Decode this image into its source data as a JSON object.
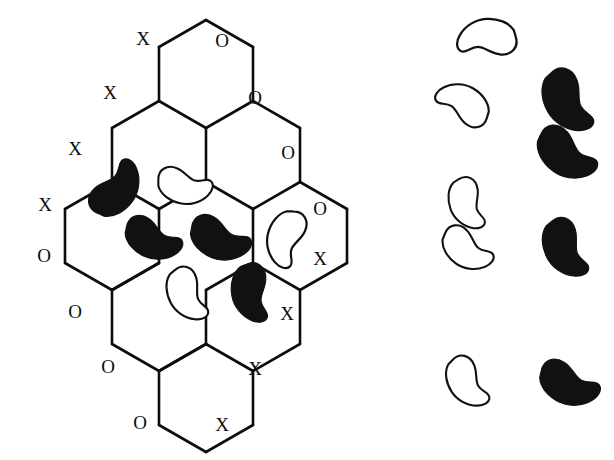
{
  "figure": {
    "width": 614,
    "height": 460,
    "background_color": "#ffffff",
    "line_color": "#0d0d0d",
    "black_bean_color": "#111111",
    "white_bean_fill": "#ffffff"
  },
  "lattice": {
    "shape": "rhombus",
    "hex_columns": 4,
    "hex_radius": 46,
    "edges": [
      [
        [
          206,
          20
        ],
        [
          253,
          47
        ]
      ],
      [
        [
          253,
          47
        ],
        [
          253,
          101
        ]
      ],
      [
        [
          253,
          101
        ],
        [
          206,
          128
        ]
      ],
      [
        [
          206,
          128
        ],
        [
          159,
          101
        ]
      ],
      [
        [
          159,
          101
        ],
        [
          159,
          47
        ]
      ],
      [
        [
          159,
          47
        ],
        [
          206,
          20
        ]
      ],
      [
        [
          253,
          101
        ],
        [
          300,
          128
        ]
      ],
      [
        [
          300,
          128
        ],
        [
          300,
          182
        ]
      ],
      [
        [
          300,
          182
        ],
        [
          253,
          209
        ]
      ],
      [
        [
          253,
          209
        ],
        [
          206,
          182
        ]
      ],
      [
        [
          206,
          182
        ],
        [
          206,
          128
        ]
      ],
      [
        [
          159,
          101
        ],
        [
          112,
          128
        ]
      ],
      [
        [
          112,
          128
        ],
        [
          112,
          182
        ]
      ],
      [
        [
          112,
          182
        ],
        [
          159,
          209
        ]
      ],
      [
        [
          159,
          209
        ],
        [
          206,
          182
        ]
      ],
      [
        [
          300,
          182
        ],
        [
          347,
          209
        ]
      ],
      [
        [
          347,
          209
        ],
        [
          347,
          263
        ]
      ],
      [
        [
          347,
          263
        ],
        [
          300,
          290
        ]
      ],
      [
        [
          300,
          290
        ],
        [
          253,
          263
        ]
      ],
      [
        [
          253,
          263
        ],
        [
          253,
          209
        ]
      ],
      [
        [
          112,
          182
        ],
        [
          65,
          209
        ]
      ],
      [
        [
          65,
          209
        ],
        [
          65,
          263
        ]
      ],
      [
        [
          65,
          263
        ],
        [
          112,
          290
        ]
      ],
      [
        [
          112,
          290
        ],
        [
          159,
          263
        ]
      ],
      [
        [
          159,
          263
        ],
        [
          159,
          209
        ]
      ],
      [
        [
          253,
          263
        ],
        [
          206,
          290
        ]
      ],
      [
        [
          206,
          290
        ],
        [
          206,
          344
        ]
      ],
      [
        [
          206,
          344
        ],
        [
          253,
          371
        ]
      ],
      [
        [
          253,
          371
        ],
        [
          300,
          344
        ]
      ],
      [
        [
          300,
          344
        ],
        [
          300,
          290
        ]
      ],
      [
        [
          159,
          263
        ],
        [
          112,
          290
        ]
      ],
      [
        [
          112,
          290
        ],
        [
          112,
          344
        ]
      ],
      [
        [
          112,
          344
        ],
        [
          159,
          371
        ]
      ],
      [
        [
          159,
          371
        ],
        [
          206,
          344
        ]
      ],
      [
        [
          206,
          344
        ],
        [
          159,
          371
        ]
      ],
      [
        [
          159,
          371
        ],
        [
          159,
          425
        ]
      ],
      [
        [
          159,
          425
        ],
        [
          206,
          452
        ]
      ],
      [
        [
          206,
          452
        ],
        [
          253,
          425
        ]
      ],
      [
        [
          253,
          425
        ],
        [
          253,
          371
        ]
      ]
    ],
    "labels": [
      {
        "text": "X",
        "x": 143,
        "y": 38
      },
      {
        "text": "X",
        "x": 110,
        "y": 92
      },
      {
        "text": "X",
        "x": 75,
        "y": 148
      },
      {
        "text": "X",
        "x": 45,
        "y": 204
      },
      {
        "text": "O",
        "x": 222,
        "y": 40
      },
      {
        "text": "O",
        "x": 255,
        "y": 97
      },
      {
        "text": "O",
        "x": 288,
        "y": 152
      },
      {
        "text": "O",
        "x": 320,
        "y": 208
      },
      {
        "text": "O",
        "x": 44,
        "y": 255
      },
      {
        "text": "O",
        "x": 75,
        "y": 311
      },
      {
        "text": "O",
        "x": 108,
        "y": 366
      },
      {
        "text": "O",
        "x": 140,
        "y": 422
      },
      {
        "text": "X",
        "x": 320,
        "y": 258
      },
      {
        "text": "X",
        "x": 287,
        "y": 313
      },
      {
        "text": "X",
        "x": 255,
        "y": 368
      },
      {
        "text": "X",
        "x": 222,
        "y": 424
      }
    ],
    "label_counts": {
      "X": 8,
      "O": 8
    }
  },
  "lattice_beans": {
    "black_count": 5,
    "white_count": 3,
    "items": [
      {
        "id": "lattice-bean-1",
        "type": "black",
        "cx": 117,
        "cy": 190,
        "rot": -58,
        "scale": 1.0
      },
      {
        "id": "lattice-bean-2",
        "type": "white",
        "cx": 184,
        "cy": 187,
        "rot": 8,
        "scale": 0.88
      },
      {
        "id": "lattice-bean-3",
        "type": "black",
        "cx": 152,
        "cy": 240,
        "rot": 20,
        "scale": 0.95
      },
      {
        "id": "lattice-bean-4",
        "type": "black",
        "cx": 219,
        "cy": 240,
        "rot": 18,
        "scale": 1.0
      },
      {
        "id": "lattice-bean-5",
        "type": "white",
        "cx": 285,
        "cy": 238,
        "rot": 100,
        "scale": 0.92
      },
      {
        "id": "lattice-bean-6",
        "type": "white",
        "cx": 186,
        "cy": 295,
        "rot": 58,
        "scale": 0.9
      },
      {
        "id": "lattice-bean-7",
        "type": "black",
        "cx": 250,
        "cy": 293,
        "rot": 75,
        "scale": 0.96
      }
    ]
  },
  "legend_column": {
    "description": "Detached bean glyphs arranged in two sub-columns",
    "white_count": 5,
    "black_count": 4,
    "items": [
      {
        "id": "legend-bean-1",
        "type": "white",
        "cx": 487,
        "cy": 37,
        "rot": 172,
        "scale": 0.95
      },
      {
        "id": "legend-bean-2",
        "type": "white",
        "cx": 464,
        "cy": 103,
        "rot": 205,
        "scale": 0.9
      },
      {
        "id": "legend-bean-3",
        "type": "black",
        "cx": 566,
        "cy": 102,
        "rot": 55,
        "scale": 1.08
      },
      {
        "id": "legend-bean-4",
        "type": "black",
        "cx": 565,
        "cy": 155,
        "rot": 32,
        "scale": 1.05
      },
      {
        "id": "legend-bean-5",
        "type": "white",
        "cx": 466,
        "cy": 204,
        "rot": 65,
        "scale": 0.85
      },
      {
        "id": "legend-bean-6",
        "type": "white",
        "cx": 466,
        "cy": 250,
        "rot": 30,
        "scale": 0.88
      },
      {
        "id": "legend-bean-7",
        "type": "black",
        "cx": 564,
        "cy": 249,
        "rot": 58,
        "scale": 1.0
      },
      {
        "id": "legend-bean-8",
        "type": "white",
        "cx": 466,
        "cy": 383,
        "rot": 52,
        "scale": 0.88
      },
      {
        "id": "legend-bean-9",
        "type": "black",
        "cx": 568,
        "cy": 385,
        "rot": 20,
        "scale": 1.0
      }
    ]
  },
  "bean_path": "M -30 -4 C -32 -16 -22 -23 -11 -20 C -2 -18 4 -10 11 -9 C 19 -8 24 -14 29 -11 C 34 -8 33 0 28 6 C 21 15 9 20 -2 19 C -14 18 -25 12 -29 3 Z"
}
